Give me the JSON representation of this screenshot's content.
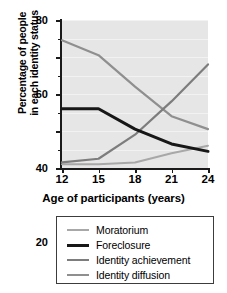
{
  "chart_data": {
    "type": "line",
    "title": "",
    "xlabel": "Age of participants (years)",
    "ylabel_line1": "Percentage of people",
    "ylabel_line2": "in each identity status",
    "x": [
      12,
      15,
      18,
      21,
      24
    ],
    "xtick_labels": [
      "12",
      "15",
      "18",
      "21",
      "24"
    ],
    "ytick_labels": [
      "0",
      "20",
      "40",
      "60",
      "80"
    ],
    "ytick_values": [
      0,
      20,
      40,
      60,
      80
    ],
    "yminor_values": [
      10,
      30,
      50,
      70
    ],
    "xlim": [
      12,
      24
    ],
    "ylim": [
      0,
      80
    ],
    "grid": true,
    "legend_position": "below",
    "plot_background": "#e6e6e6",
    "series": [
      {
        "name": "Moratorium",
        "values": [
          2,
          2,
          3,
          8,
          12
        ],
        "color": "#a8a8a8",
        "width": 2.0
      },
      {
        "name": "Foreclosure",
        "values": [
          32,
          32,
          21,
          13,
          9
        ],
        "color": "#171717",
        "width": 3.0
      },
      {
        "name": "Identity achievement",
        "values": [
          3,
          5,
          18,
          36,
          56
        ],
        "color": "#7d7d7d",
        "width": 2.2
      },
      {
        "name": "Identity diffusion",
        "values": [
          69,
          61,
          44,
          28,
          21
        ],
        "color": "#8f8f8f",
        "width": 2.2
      }
    ]
  },
  "legend": {
    "items": [
      {
        "label": "Moratorium",
        "color": "#a8a8a8",
        "thickness": "2px"
      },
      {
        "label": "Foreclosure",
        "color": "#171717",
        "thickness": "3px"
      },
      {
        "label": "Identity achievement",
        "color": "#7d7d7d",
        "thickness": "2px"
      },
      {
        "label": "Identity diffusion",
        "color": "#8f8f8f",
        "thickness": "2px"
      }
    ]
  }
}
